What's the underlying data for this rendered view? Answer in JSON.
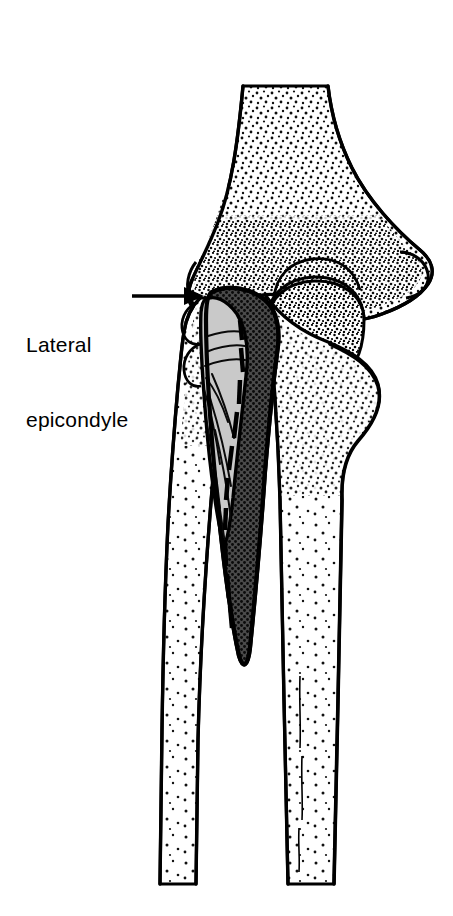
{
  "figure": {
    "background_color": "#ffffff",
    "line_color": "#000000",
    "width": 453,
    "height": 916
  },
  "labels": [
    {
      "name": "lateral-epicondyle",
      "line1": "Lateral",
      "line2": "epicondyle",
      "x": 26,
      "y": 282,
      "font_size": 21,
      "color": "#000000",
      "leader": {
        "type": "arrow",
        "direction": "right",
        "from_x": 132,
        "from_y": 296,
        "to_x": 202,
        "to_y": 296
      }
    }
  ],
  "structures": [
    {
      "name": "humerus-shaft",
      "label": "Humerus shaft",
      "fill": "#ffffff",
      "texture": "stipple",
      "texture_density": "sparse",
      "stroke": "#000000",
      "stroke_width": 3
    },
    {
      "name": "humerus-distal-epiphysis",
      "label": "Distal humerus (condyles)",
      "fill": "#ffffff",
      "texture": "stipple",
      "texture_density": "dense",
      "stroke": "#000000",
      "stroke_width": 3
    },
    {
      "name": "lateral-epicondyle-prominence",
      "label": "Lateral epicondyle",
      "fill": "#ffffff",
      "texture": "stipple",
      "stroke": "#000000"
    },
    {
      "name": "medial-epicondyle-prominence",
      "label": "Medial epicondyle",
      "fill": "#ffffff",
      "texture": "stipple",
      "stroke": "#000000"
    },
    {
      "name": "capitellum-trochlea",
      "label": "Capitellum and trochlea",
      "fill": "#ffffff",
      "texture": "stipple",
      "texture_density": "dense",
      "stroke": "#000000"
    },
    {
      "name": "radius",
      "label": "Radius",
      "fill": "#ffffff",
      "texture": "stipple",
      "stroke": "#000000",
      "stroke_width": 3
    },
    {
      "name": "ulna",
      "label": "Ulna",
      "fill": "#ffffff",
      "texture": "stipple",
      "stroke": "#000000",
      "stroke_width": 3
    },
    {
      "name": "muscle-belly-light",
      "label": "Muscle belly (superficial, light tone)",
      "fill": "#c9c9c9",
      "texture": "fiber-lines",
      "stroke": "#000000",
      "stroke_width": 4
    },
    {
      "name": "muscle-belly-dark",
      "label": "Muscle belly (deep, dark tone)",
      "fill": "#595959",
      "texture": "cross-hatch",
      "stroke": "#000000",
      "stroke_width": 4
    }
  ],
  "colors": {
    "background": "#ffffff",
    "ink": "#000000",
    "muscle_light": "#c9c9c9",
    "muscle_dark": "#595959",
    "bone_fill": "#ffffff"
  }
}
